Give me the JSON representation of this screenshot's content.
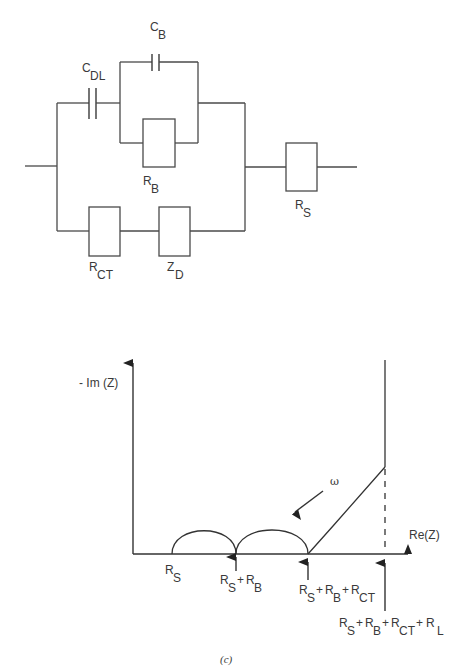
{
  "circuit": {
    "components": {
      "c_dl": {
        "main": "C",
        "sub": "DL"
      },
      "c_b": {
        "main": "C",
        "sub": "B"
      },
      "r_b": {
        "main": "R",
        "sub": "B"
      },
      "r_ct": {
        "main": "R",
        "sub": "CT"
      },
      "z_d": {
        "main": "Z",
        "sub": "D"
      },
      "r_s": {
        "main": "R",
        "sub": "S"
      }
    }
  },
  "plot": {
    "y_axis_label": "- Im (Z)",
    "x_axis_label": "Re(Z)",
    "omega_label": "ω",
    "markers": {
      "m1": {
        "parts": [
          {
            "main": "R",
            "sub": "S"
          }
        ]
      },
      "m2": {
        "parts": [
          {
            "main": "R",
            "sub": "S"
          },
          {
            "main": "R",
            "sub": "B"
          }
        ]
      },
      "m3": {
        "parts": [
          {
            "main": "R",
            "sub": "S"
          },
          {
            "main": "R",
            "sub": "B"
          },
          {
            "main": "R",
            "sub": "CT"
          }
        ]
      },
      "m4": {
        "parts": [
          {
            "main": "R",
            "sub": "S"
          },
          {
            "main": "R",
            "sub": "B"
          },
          {
            "main": "R",
            "sub": "CT"
          },
          {
            "main": "R",
            "sub": "L"
          }
        ]
      }
    },
    "plus": "+"
  },
  "caption": "(c)"
}
